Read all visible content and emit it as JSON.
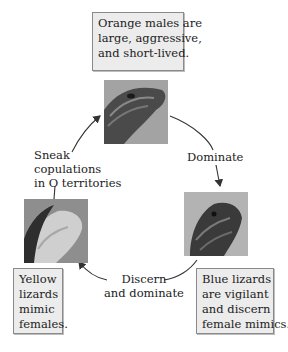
{
  "figure": {
    "morphs": {
      "orange": {
        "description_lines": [
          "Orange males are",
          "large, aggressive,",
          "and short-lived."
        ]
      },
      "blue": {
        "description_lines": [
          "Blue lizards",
          "are vigilant",
          "and discern",
          "female mimics."
        ]
      },
      "yellow": {
        "description_lines": [
          "Yellow",
          "lizards",
          "mimic",
          "females."
        ]
      }
    },
    "interactions": {
      "orange_to_blue": {
        "lines": [
          "Dominate"
        ]
      },
      "blue_to_yellow": {
        "lines": [
          "Discern",
          "and dominate"
        ]
      },
      "yellow_to_orange": {
        "lines": [
          "Sneak",
          "copulations",
          "in O territories"
        ]
      }
    },
    "colors": {
      "box_fill": "#ececec",
      "box_border": "#8a8a8a",
      "arrow": "#333333",
      "photo_gray": "#9c9c9c"
    }
  }
}
